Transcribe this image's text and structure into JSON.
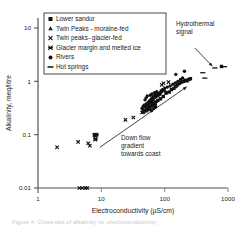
{
  "chart_data": {
    "type": "scatter",
    "title": "",
    "xlabel": "Electroconductivity (µS/cm)",
    "ylabel": "Alkalinity, meq/litre",
    "xscale": "log",
    "yscale": "log",
    "xlim": [
      1,
      1000
    ],
    "ylim": [
      0.01,
      20
    ],
    "xticks": [
      "1",
      "10",
      "100",
      "1000"
    ],
    "yticks": [
      "10",
      "1",
      "0.1",
      "0.01"
    ],
    "grid": false,
    "legend_position": "top-left",
    "series": [
      {
        "name": "Lower sandur",
        "marker": "square",
        "points": [
          [
            95,
            0.52
          ],
          [
            105,
            0.6
          ],
          [
            118,
            0.63
          ],
          [
            128,
            0.7
          ],
          [
            140,
            0.74
          ],
          [
            150,
            0.8
          ],
          [
            160,
            0.86
          ],
          [
            172,
            0.92
          ],
          [
            185,
            0.97
          ],
          [
            198,
            1.0
          ],
          [
            210,
            1.05
          ],
          [
            225,
            1.02
          ],
          [
            240,
            1.08
          ],
          [
            255,
            1.12
          ],
          [
            86,
            0.47
          ],
          [
            78,
            0.44
          ],
          [
            70,
            0.41
          ],
          [
            64,
            0.38
          ],
          [
            790,
            1.9
          ]
        ]
      },
      {
        "name": "Twin Peaks - moraine-fed",
        "marker": "triangle",
        "points": [
          [
            58,
            0.33
          ],
          [
            62,
            0.35
          ],
          [
            66,
            0.36
          ],
          [
            60,
            0.31
          ],
          [
            55,
            0.3
          ],
          [
            70,
            0.39
          ],
          [
            74,
            0.42
          ]
        ]
      },
      {
        "name": "Twin peaks- glacier-fed",
        "marker": "x",
        "points": [
          [
            2.0,
            0.058
          ],
          [
            4.3,
            0.073
          ],
          [
            6.2,
            0.069
          ],
          [
            6.6,
            0.062
          ],
          [
            7.8,
            0.098
          ],
          [
            8.2,
            0.098
          ],
          [
            8.0,
            0.081
          ],
          [
            24,
            0.19
          ],
          [
            32,
            0.21
          ],
          [
            44,
            0.26
          ],
          [
            50,
            0.28
          ],
          [
            56,
            0.3
          ],
          [
            90,
            0.86
          ],
          [
            96,
            0.92
          ],
          [
            115,
            0.97
          ],
          [
            4.5,
            0.01
          ],
          [
            5.0,
            0.01
          ],
          [
            5.6,
            0.01
          ],
          [
            6.0,
            0.01
          ]
        ]
      },
      {
        "name": "Glacier margin and melted ice",
        "marker": "star-x",
        "points": [
          [
            7.9,
            0.1
          ],
          [
            8.4,
            0.1
          ],
          [
            8.1,
            0.084
          ],
          [
            46,
            0.265
          ],
          [
            52,
            0.285
          ],
          [
            70,
            0.345
          ]
        ]
      },
      {
        "name": "Rivers",
        "marker": "circle",
        "points": [
          [
            46,
            0.34
          ],
          [
            48,
            0.36
          ],
          [
            50,
            0.33
          ],
          [
            52,
            0.38
          ],
          [
            54,
            0.35
          ],
          [
            55,
            0.4
          ],
          [
            56,
            0.37
          ],
          [
            57,
            0.42
          ],
          [
            58,
            0.39
          ],
          [
            59,
            0.44
          ],
          [
            60,
            0.41
          ],
          [
            61,
            0.46
          ],
          [
            62,
            0.43
          ],
          [
            63,
            0.48
          ],
          [
            64,
            0.45
          ],
          [
            65,
            0.5
          ],
          [
            66,
            0.47
          ],
          [
            67,
            0.52
          ],
          [
            68,
            0.49
          ],
          [
            70,
            0.54
          ],
          [
            72,
            0.51
          ],
          [
            74,
            0.56
          ],
          [
            76,
            0.53
          ],
          [
            78,
            0.58
          ],
          [
            80,
            0.55
          ],
          [
            82,
            0.6
          ],
          [
            84,
            0.57
          ],
          [
            86,
            0.62
          ],
          [
            53,
            0.3
          ],
          [
            57,
            0.32
          ],
          [
            61,
            0.34
          ],
          [
            66,
            0.36
          ],
          [
            71,
            0.38
          ],
          [
            49,
            0.45
          ],
          [
            51,
            0.49
          ],
          [
            53,
            0.53
          ],
          [
            59,
            0.55
          ],
          [
            63,
            0.58
          ],
          [
            69,
            0.61
          ],
          [
            75,
            0.64
          ],
          [
            88,
            0.66
          ],
          [
            92,
            0.7
          ],
          [
            100,
            0.74
          ],
          [
            110,
            0.78
          ],
          [
            122,
            0.82
          ],
          [
            135,
            0.88
          ],
          [
            148,
            0.93
          ],
          [
            162,
            1.0
          ],
          [
            178,
            1.08
          ],
          [
            192,
            1.16
          ],
          [
            150,
            1.35
          ],
          [
            205,
            1.55
          ],
          [
            44,
            0.31
          ],
          [
            47,
            0.29
          ],
          [
            62,
            0.28
          ],
          [
            67,
            0.31
          ],
          [
            72,
            0.33
          ],
          [
            90,
            0.64
          ],
          [
            98,
            0.68
          ],
          [
            106,
            0.62
          ]
        ]
      },
      {
        "name": "Hot springs",
        "marker": "dash",
        "points": [
          [
            400,
            1.45
          ],
          [
            430,
            1.15
          ],
          [
            620,
            1.78
          ],
          [
            880,
            1.88
          ]
        ]
      }
    ],
    "annotations": [
      {
        "name": "hydrothermal-signal",
        "text_lines": [
          "Hydrothermal",
          "signal"
        ],
        "arrow_from": [
          300,
          4.2
        ],
        "arrow_to": [
          560,
          1.95
        ]
      },
      {
        "name": "down-flow-gradient",
        "text_lines": [
          "Down flow",
          "gradient",
          "towards coast"
        ],
        "arrow_from": [
          9.5,
          0.058
        ],
        "arrow_to": [
          220,
          0.78
        ]
      }
    ]
  },
  "legend": {
    "entries": [
      {
        "label": "Lower sandur",
        "marker": "square"
      },
      {
        "label": "Twin Peaks - moraine-fed",
        "marker": "triangle"
      },
      {
        "label": "Twin peaks- glacier-fed",
        "marker": "x"
      },
      {
        "label": "Glacier margin and melted ice",
        "marker": "star-x"
      },
      {
        "label": "Rivers",
        "marker": "circle"
      },
      {
        "label": "Hot springs",
        "marker": "dash"
      }
    ]
  },
  "axes": {
    "x_title": "Electroconductivity (µS/cm)",
    "y_title": "Alkalinity, meq/litre",
    "x_tick_labels": [
      "1",
      "10",
      "100",
      "1000"
    ],
    "y_tick_labels": [
      "10",
      "1",
      "0.1",
      "0.01"
    ]
  },
  "annotations": {
    "hydrothermal_line1": "Hydrothermal",
    "hydrothermal_line2": "signal",
    "downflow_line1": "Down flow",
    "downflow_line2": "gradient",
    "downflow_line3": "towards coast"
  },
  "caption": "Figure 4. Cross-plot of alkalinity vs. electroconductivity"
}
